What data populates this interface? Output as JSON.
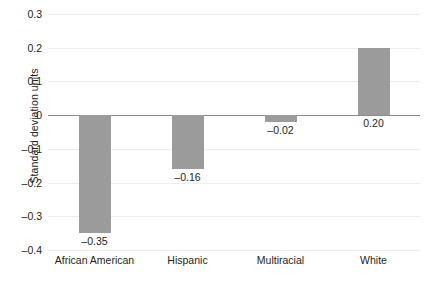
{
  "chart_data": {
    "type": "bar",
    "title": "",
    "xlabel": "",
    "ylabel": "Standard deviation units",
    "categories": [
      "African American",
      "Hispanic",
      "Multiracial",
      "White"
    ],
    "values": [
      -0.35,
      -0.16,
      -0.02,
      0.2
    ],
    "value_labels": [
      "–0.35",
      "–0.16",
      "–0.02",
      "0.20"
    ],
    "ylim": [
      -0.4,
      0.3
    ],
    "ytick_values": [
      0.3,
      0.2,
      0.1,
      0,
      -0.1,
      -0.2,
      -0.3,
      -0.4
    ],
    "ytick_labels": [
      "0.3",
      "0.2",
      "0.1",
      "0",
      "–0.1",
      "–0.2",
      "–0.3",
      "–0.4"
    ],
    "grid": true,
    "legend": null,
    "bar_color": "#9b9b9b",
    "gridline_color": "#ededed",
    "zero_line_color": "#8a8a8a"
  }
}
